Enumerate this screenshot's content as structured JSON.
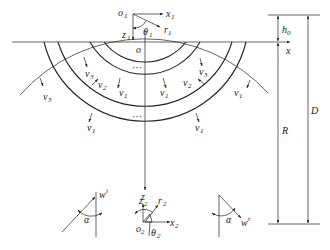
{
  "figure": {
    "origin_labels": {
      "o": "o",
      "o1": {
        "main": "o",
        "sub": "1"
      },
      "o2": {
        "main": "o",
        "sub": "2"
      }
    },
    "axis_labels": {
      "x": "x",
      "z": "z",
      "x1": {
        "main": "x",
        "sub": "1"
      },
      "z1": {
        "main": "z",
        "sub": "1"
      },
      "r1": {
        "main": "r",
        "sub": "1"
      },
      "theta1": {
        "main": "θ",
        "sub": "1"
      },
      "x2": {
        "main": "x",
        "sub": "2"
      },
      "z2": {
        "main": "z",
        "sub": "2"
      },
      "r2": {
        "main": "r",
        "sub": "2"
      },
      "theta2": {
        "main": "θ",
        "sub": "2"
      }
    },
    "dimensions": {
      "h0": {
        "main": "h",
        "sub": "0"
      },
      "R": "R",
      "D": "D"
    },
    "wave_labels": {
      "v1": {
        "main": "v",
        "sub": "1"
      },
      "v2": {
        "main": "v",
        "sub": "2"
      },
      "v3": {
        "main": "v",
        "sub": "3"
      }
    },
    "ellipsis": "···",
    "incident_left": {
      "w": "w",
      "sup": "i",
      "alpha": "α"
    },
    "incident_right": {
      "w": "w",
      "sup": "r",
      "alpha": "α"
    }
  }
}
